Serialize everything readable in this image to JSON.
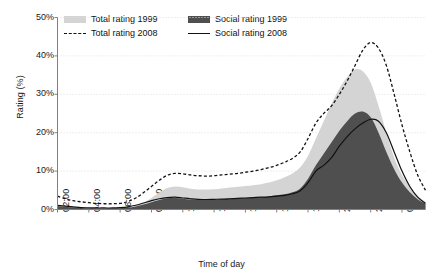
{
  "chart_data": {
    "type": "area",
    "title": "",
    "xlabel": "Time of day",
    "ylabel": "Rating (%)",
    "ylim": [
      0,
      50
    ],
    "ytick_labels": [
      "0%",
      "10%",
      "20%",
      "30%",
      "40%",
      "50%"
    ],
    "ytick_values": [
      0,
      10,
      20,
      30,
      40,
      50
    ],
    "grid": "horizontal-dotted",
    "legend_position": "top-inside",
    "xlim_hours": [
      2,
      25.5
    ],
    "xtick_labels": [
      "02:00",
      "04:00",
      "06:00",
      "08:00",
      "10:00",
      "12:00",
      "14:00",
      "16:00",
      "18:00",
      "20:00",
      "22:00",
      "00:00"
    ],
    "xtick_hours": [
      2,
      4,
      6,
      8,
      10,
      12,
      14,
      16,
      18,
      20,
      22,
      24
    ],
    "x": [
      2,
      2.5,
      3,
      3.5,
      4,
      4.5,
      5,
      5.5,
      6,
      6.5,
      7,
      7.5,
      8,
      8.5,
      9,
      9.5,
      10,
      10.5,
      11,
      11.5,
      12,
      12.5,
      13,
      13.5,
      14,
      14.5,
      15,
      15.5,
      16,
      16.5,
      17,
      17.5,
      18,
      18.5,
      19,
      19.5,
      20,
      20.5,
      21,
      21.5,
      22,
      22.5,
      23,
      23.5,
      24,
      24.5,
      25,
      25.5
    ],
    "series": [
      {
        "name": "Total rating 1999",
        "style": "filled-area-light",
        "color": "#d4d4d4",
        "values": [
          1.0,
          0.8,
          0.6,
          0.5,
          0.4,
          0.3,
          0.3,
          0.3,
          0.4,
          0.6,
          1.0,
          1.8,
          3.0,
          4.4,
          5.6,
          6.0,
          5.8,
          5.4,
          5.2,
          5.2,
          5.3,
          5.5,
          5.7,
          5.9,
          6.1,
          6.3,
          6.6,
          7.0,
          7.6,
          8.4,
          9.4,
          11.0,
          14.0,
          18.5,
          23.0,
          27.5,
          31.5,
          34.5,
          36.5,
          36.0,
          33.0,
          27.0,
          20.0,
          13.5,
          9.0,
          6.0,
          3.6,
          2.0
        ]
      },
      {
        "name": "Social rating 1999",
        "style": "filled-area-dark",
        "color": "#4f4f4f",
        "values": [
          0.9,
          0.7,
          0.5,
          0.4,
          0.3,
          0.25,
          0.25,
          0.3,
          0.35,
          0.5,
          0.8,
          1.3,
          1.9,
          2.5,
          2.9,
          3.0,
          2.8,
          2.6,
          2.5,
          2.5,
          2.6,
          2.7,
          2.8,
          2.9,
          3.0,
          3.1,
          3.2,
          3.4,
          3.7,
          4.0,
          4.5,
          5.5,
          8.0,
          11.5,
          14.5,
          17.5,
          20.5,
          23.0,
          25.0,
          25.5,
          24.0,
          20.0,
          15.0,
          10.5,
          7.0,
          4.5,
          2.7,
          1.5
        ]
      },
      {
        "name": "Total rating 2008",
        "style": "dashed-line",
        "color": "#111111",
        "values": [
          3.5,
          2.8,
          2.3,
          2.0,
          1.8,
          1.6,
          1.5,
          1.5,
          1.6,
          2.1,
          3.0,
          4.4,
          6.0,
          7.6,
          8.9,
          9.4,
          9.3,
          9.0,
          8.8,
          8.7,
          8.8,
          9.0,
          9.2,
          9.4,
          9.7,
          10.0,
          10.4,
          10.9,
          11.5,
          12.3,
          13.3,
          15.0,
          18.5,
          22.5,
          25.0,
          27.0,
          30.0,
          33.5,
          37.5,
          41.5,
          43.5,
          42.0,
          37.5,
          30.0,
          22.0,
          15.0,
          9.0,
          5.0
        ]
      },
      {
        "name": "Social rating 2008",
        "style": "solid-line",
        "color": "#111111",
        "values": [
          1.1,
          0.9,
          0.7,
          0.5,
          0.45,
          0.4,
          0.4,
          0.4,
          0.5,
          0.7,
          1.1,
          1.7,
          2.3,
          2.8,
          3.1,
          3.2,
          3.0,
          2.8,
          2.65,
          2.6,
          2.65,
          2.7,
          2.8,
          2.9,
          3.0,
          3.1,
          3.2,
          3.3,
          3.5,
          3.7,
          4.1,
          4.9,
          7.0,
          10.0,
          11.5,
          13.5,
          16.5,
          19.0,
          21.0,
          22.5,
          23.5,
          23.0,
          20.0,
          15.0,
          10.0,
          6.0,
          3.2,
          1.6
        ]
      }
    ]
  },
  "legend": {
    "items": [
      {
        "label": "Total rating 1999",
        "swatch": "fill-light"
      },
      {
        "label": "Social rating 1999",
        "swatch": "fill-dark"
      },
      {
        "label": "Total rating 2008",
        "swatch": "line-dashed"
      },
      {
        "label": "Social rating 2008",
        "swatch": "line-solid"
      }
    ]
  },
  "axes": {
    "y_title": "Rating (%)",
    "x_title": "Time of day"
  },
  "colors": {
    "total_1999_fill": "#d4d4d4",
    "social_1999_fill": "#4f4f4f",
    "line_2008": "#111111",
    "axis": "#808080",
    "gridline": "#dedede",
    "background": "#ffffff"
  }
}
